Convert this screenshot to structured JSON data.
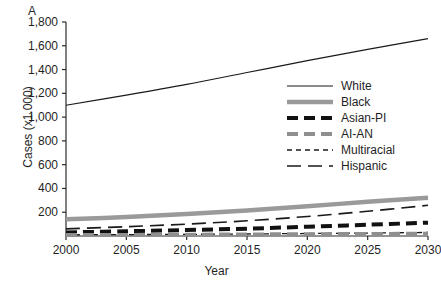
{
  "figure": {
    "panel_label": "A"
  },
  "chart_data": {
    "type": "line",
    "title": "",
    "xlabel": "Year",
    "ylabel": "Cases (x1.000)",
    "xlim": [
      2000,
      2030
    ],
    "ylim": [
      0,
      1800
    ],
    "grid": false,
    "legend_position": "center-right",
    "xticks": [
      "2000",
      "2005",
      "2010",
      "2015",
      "2020",
      "2025",
      "2030"
    ],
    "xtick_values": [
      2000,
      2005,
      2010,
      2015,
      2020,
      2025,
      2030
    ],
    "yticks": [
      "200",
      "400",
      "600",
      "800",
      "1,000",
      "1,200",
      "1,400",
      "1,600",
      "1,800"
    ],
    "ytick_values": [
      200,
      400,
      600,
      800,
      1000,
      1200,
      1400,
      1600,
      1800
    ],
    "x": [
      2000,
      2005,
      2010,
      2015,
      2020,
      2025,
      2030
    ],
    "series": [
      {
        "name": "White",
        "style": "solid-thin",
        "color": "#1a1a1a",
        "width": 1.2,
        "dash": "",
        "values": [
          1100,
          1185,
          1275,
          1375,
          1475,
          1570,
          1660
        ]
      },
      {
        "name": "Black",
        "style": "solid-thick",
        "color": "#9a9a9a",
        "width": 4.5,
        "dash": "",
        "values": [
          140,
          160,
          185,
          215,
          250,
          288,
          322
        ]
      },
      {
        "name": "Asian-PI",
        "style": "dashed-thick",
        "color": "#111111",
        "width": 4,
        "dash": "11,6",
        "values": [
          30,
          40,
          50,
          62,
          78,
          95,
          112
        ]
      },
      {
        "name": "AI-AN",
        "style": "dashed-thick",
        "color": "#8f8f8f",
        "width": 4,
        "dash": "11,6",
        "values": [
          8,
          9,
          11,
          13,
          15,
          17,
          19
        ]
      },
      {
        "name": "Multiracial",
        "style": "dashed-thin-short",
        "color": "#1a1a1a",
        "width": 1.3,
        "dash": "5,4",
        "values": [
          10,
          12,
          14,
          17,
          21,
          25,
          30
        ]
      },
      {
        "name": "Hispanic",
        "style": "dashed-thin-long",
        "color": "#1a1a1a",
        "width": 1.6,
        "dash": "14,7",
        "values": [
          60,
          78,
          100,
          128,
          164,
          208,
          258
        ]
      }
    ]
  }
}
